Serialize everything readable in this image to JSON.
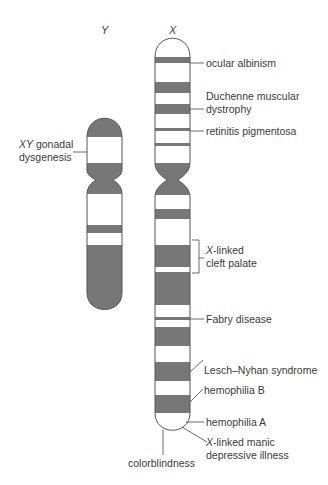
{
  "figure": {
    "colors": {
      "band": "#777777",
      "outline": "#555555",
      "background": "#ffffff",
      "text": "#3a3a3a"
    },
    "chromosomes": [
      {
        "id": "Y",
        "title": "Y",
        "x_left": 87,
        "x_right": 122,
        "top": 120,
        "bottom": 310,
        "centromere_y": 180,
        "dark_bands": [
          [
            120,
            137
          ],
          [
            163,
            194
          ],
          [
            225,
            233
          ],
          [
            245,
            310
          ]
        ]
      },
      {
        "id": "X",
        "title": "X",
        "x_left": 155,
        "x_right": 190,
        "top": 40,
        "bottom": 430,
        "centromere_y": 180,
        "dark_bands": [
          [
            57,
            63
          ],
          [
            82,
            93
          ],
          [
            104,
            114
          ],
          [
            128,
            131
          ],
          [
            143,
            146
          ],
          [
            163,
            195
          ],
          [
            209,
            219
          ],
          [
            245,
            267
          ],
          [
            272,
            305
          ],
          [
            317,
            320
          ],
          [
            327,
            346
          ],
          [
            362,
            381
          ],
          [
            395,
            413
          ]
        ]
      }
    ],
    "labels": {
      "xy_gonadal_prefix": "XY",
      "xy_gonadal_rest": " gonadal",
      "xy_gonadal_line2": "dysgenesis",
      "ocular_albinism": "ocular albinism",
      "duchenne_line1": "Duchenne muscular",
      "duchenne_line2": "dystrophy",
      "retinitis": "retinitis pigmentosa",
      "cleft_prefix": "X",
      "cleft_rest": "-linked",
      "cleft_line2": "cleft palate",
      "fabry": "Fabry disease",
      "lesch": "Lesch–Nyhan syndrome",
      "hemophilia_b": "hemophilia B",
      "hemophilia_a": "hemophilia A",
      "manic_prefix": "X",
      "manic_rest": "-linked manic",
      "manic_line2": "depressive illness",
      "colorblindness": "colorblindness"
    }
  }
}
